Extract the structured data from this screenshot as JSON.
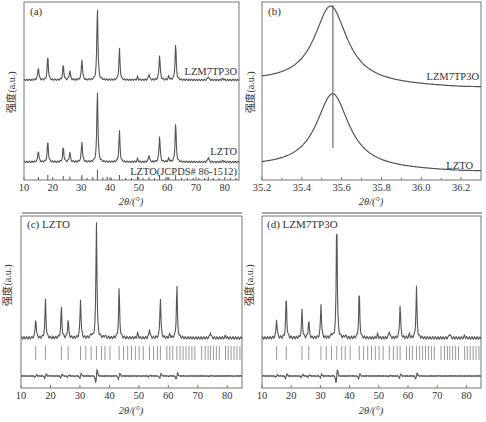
{
  "colors": {
    "line": "#555555",
    "axis": "#777777",
    "ticks_ref": "#999999",
    "text": "#333333"
  },
  "chart_data": [
    {
      "panel": "a",
      "label": "(a)",
      "type": "line",
      "xlabel": "2θ/(°)",
      "ylabel": "强度(a.u.)",
      "xlim": [
        10,
        85
      ],
      "xticks": [
        10,
        20,
        30,
        40,
        50,
        60,
        70,
        80
      ],
      "grid": false,
      "series": [
        {
          "name": "LZM7TP3O",
          "peaks": [
            [
              15.0,
              0.18
            ],
            [
              18.3,
              0.33
            ],
            [
              23.7,
              0.21
            ],
            [
              26.0,
              0.13
            ],
            [
              30.2,
              0.29
            ],
            [
              35.6,
              1.0
            ],
            [
              43.3,
              0.43
            ],
            [
              49.6,
              0.04
            ],
            [
              53.6,
              0.08
            ],
            [
              57.3,
              0.35
            ],
            [
              60.5,
              0.05
            ],
            [
              62.9,
              0.5
            ],
            [
              74.3,
              0.05
            ],
            [
              79.4,
              0.02
            ]
          ]
        },
        {
          "name": "LZTO",
          "peaks": [
            [
              15.0,
              0.16
            ],
            [
              18.3,
              0.29
            ],
            [
              23.7,
              0.21
            ],
            [
              26.0,
              0.14
            ],
            [
              30.2,
              0.29
            ],
            [
              35.6,
              1.0
            ],
            [
              43.3,
              0.43
            ],
            [
              49.6,
              0.04
            ],
            [
              53.6,
              0.1
            ],
            [
              57.3,
              0.37
            ],
            [
              60.5,
              0.05
            ],
            [
              62.9,
              0.55
            ],
            [
              74.3,
              0.07
            ],
            [
              79.4,
              0.02
            ]
          ]
        },
        {
          "name": "LZTO(JCPDS# 86-1512)",
          "type": "stick",
          "peaks": [
            [
              15.0,
              0.3
            ],
            [
              18.3,
              0.5
            ],
            [
              20.0,
              0.2
            ],
            [
              23.7,
              0.4
            ],
            [
              26.0,
              0.35
            ],
            [
              30.2,
              0.5
            ],
            [
              32.0,
              0.2
            ],
            [
              34.0,
              0.3
            ],
            [
              35.6,
              1.0
            ],
            [
              37.5,
              0.25
            ],
            [
              39.0,
              0.3
            ],
            [
              40.5,
              0.2
            ],
            [
              43.3,
              0.5
            ],
            [
              45.5,
              0.2
            ],
            [
              47.5,
              0.2
            ],
            [
              49.6,
              0.35
            ],
            [
              51.5,
              0.2
            ],
            [
              53.6,
              0.3
            ],
            [
              55.5,
              0.2
            ],
            [
              57.3,
              0.5
            ],
            [
              59.5,
              0.25
            ],
            [
              60.5,
              0.3
            ],
            [
              62.9,
              0.55
            ],
            [
              65.0,
              0.2
            ],
            [
              67.0,
              0.2
            ],
            [
              69.0,
              0.2
            ],
            [
              71.0,
              0.2
            ],
            [
              73.0,
              0.2
            ],
            [
              74.3,
              0.3
            ],
            [
              76.0,
              0.2
            ],
            [
              78.0,
              0.2
            ],
            [
              80.0,
              0.2
            ],
            [
              82.0,
              0.2
            ],
            [
              84.0,
              0.2
            ]
          ]
        }
      ]
    },
    {
      "panel": "b",
      "label": "(b)",
      "type": "line",
      "xlabel": "2θ/(°)",
      "ylabel": "强度(a.u.)",
      "xlim": [
        35.2,
        36.3
      ],
      "xticks": [
        35.2,
        35.4,
        35.6,
        35.8,
        36.0,
        36.2
      ],
      "reference_line_x": 35.556,
      "series": [
        {
          "name": "LZM7TP3O",
          "peak_center": 35.545,
          "fwhm": 0.18
        },
        {
          "name": "LZTO",
          "peak_center": 35.555,
          "fwhm": 0.18
        }
      ]
    },
    {
      "panel": "c",
      "label": "(c) LZTO",
      "type": "line",
      "xlabel": "2θ/(°)",
      "ylabel": "强度(a.u.)",
      "xlim": [
        10,
        85
      ],
      "xticks": [
        10,
        20,
        30,
        40,
        50,
        60,
        70,
        80
      ],
      "series": [
        {
          "name": "observed/calculated",
          "peaks": [
            [
              15.0,
              0.17
            ],
            [
              18.3,
              0.33
            ],
            [
              23.7,
              0.27
            ],
            [
              26.0,
              0.16
            ],
            [
              30.2,
              0.33
            ],
            [
              33.8,
              0.03
            ],
            [
              35.6,
              1.0
            ],
            [
              38.5,
              0.02
            ],
            [
              43.3,
              0.43
            ],
            [
              49.6,
              0.04
            ],
            [
              53.6,
              0.08
            ],
            [
              57.3,
              0.35
            ],
            [
              60.5,
              0.03
            ],
            [
              62.9,
              0.45
            ],
            [
              74.3,
              0.05
            ],
            [
              79.4,
              0.02
            ]
          ]
        },
        {
          "name": "Bragg positions",
          "type": "stick"
        },
        {
          "name": "difference",
          "type": "residual"
        }
      ]
    },
    {
      "panel": "d",
      "label": "(d) LZM7TP3O",
      "type": "line",
      "xlabel": "2θ/(°)",
      "ylabel": "强度(a.u.)",
      "xlim": [
        10,
        85
      ],
      "xticks": [
        10,
        20,
        30,
        40,
        50,
        60,
        70,
        80
      ],
      "series": [
        {
          "name": "observed/calculated",
          "peaks": [
            [
              15.0,
              0.16
            ],
            [
              18.3,
              0.34
            ],
            [
              23.7,
              0.23
            ],
            [
              26.0,
              0.15
            ],
            [
              30.2,
              0.28
            ],
            [
              33.8,
              0.03
            ],
            [
              35.6,
              1.0
            ],
            [
              38.5,
              0.02
            ],
            [
              43.3,
              0.39
            ],
            [
              49.6,
              0.03
            ],
            [
              53.6,
              0.06
            ],
            [
              57.3,
              0.28
            ],
            [
              60.5,
              0.03
            ],
            [
              62.9,
              0.42
            ],
            [
              74.3,
              0.04
            ],
            [
              79.4,
              0.02
            ]
          ]
        },
        {
          "name": "Bragg positions",
          "type": "stick"
        },
        {
          "name": "difference",
          "type": "residual"
        }
      ]
    }
  ],
  "panels": {
    "a": {
      "label": "(a)",
      "series_labels": [
        "LZM7TP3O",
        "LZTO",
        "LZTO(JCPDS# 86-1512)"
      ],
      "xlabel": "2θ/(°)",
      "ylabel": "强度(a.u.)",
      "ticks": [
        "10",
        "20",
        "30",
        "40",
        "50",
        "60",
        "70",
        "80"
      ]
    },
    "b": {
      "label": "(b)",
      "series_labels": [
        "LZM7TP3O",
        "LZTO"
      ],
      "xlabel": "2θ/(°)",
      "ylabel": "强度(a.u.)",
      "ticks": [
        "35.2",
        "35.4",
        "35.6",
        "35.8",
        "36.0",
        "36.2"
      ]
    },
    "c": {
      "label": "(c) LZTO",
      "xlabel": "2θ/(°)",
      "ylabel": "强度(a.u.)",
      "ticks": [
        "10",
        "20",
        "30",
        "40",
        "50",
        "60",
        "70",
        "80"
      ]
    },
    "d": {
      "label": "(d) LZM7TP3O",
      "xlabel": "2θ/(°)",
      "ylabel": "强度(a.u.)",
      "ticks": [
        "10",
        "20",
        "30",
        "40",
        "50",
        "60",
        "70",
        "80"
      ]
    }
  }
}
